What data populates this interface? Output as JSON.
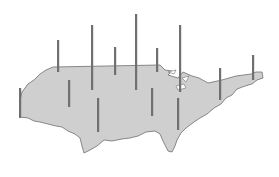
{
  "figure": {
    "type": "spike-map",
    "region": "contiguous-united-states",
    "colors": {
      "background": "#ffffff",
      "land_fill": "#cfcfcf",
      "land_stroke": "#6e6e6e",
      "spike": "#707070"
    },
    "spikes": [
      {
        "id": "west-coast",
        "x": 20,
        "base": 118,
        "top": 88
      },
      {
        "id": "northwest-interior",
        "x": 58,
        "base": 72,
        "top": 40
      },
      {
        "id": "great-basin",
        "x": 69,
        "base": 107,
        "top": 80
      },
      {
        "id": "northern-rockies",
        "x": 92,
        "base": 90,
        "top": 25
      },
      {
        "id": "southwest",
        "x": 98,
        "base": 132,
        "top": 98
      },
      {
        "id": "northern-plains",
        "x": 115,
        "base": 75,
        "top": 47
      },
      {
        "id": "central-plains",
        "x": 136,
        "base": 90,
        "top": 14
      },
      {
        "id": "south-central",
        "x": 152,
        "base": 116,
        "top": 88
      },
      {
        "id": "upper-midwest",
        "x": 157,
        "base": 72,
        "top": 48
      },
      {
        "id": "great-lakes",
        "x": 180,
        "base": 92,
        "top": 25
      },
      {
        "id": "southeast",
        "x": 178,
        "base": 130,
        "top": 98
      },
      {
        "id": "mid-atlantic",
        "x": 220,
        "base": 100,
        "top": 68
      },
      {
        "id": "new-england",
        "x": 253,
        "base": 80,
        "top": 55
      }
    ]
  }
}
